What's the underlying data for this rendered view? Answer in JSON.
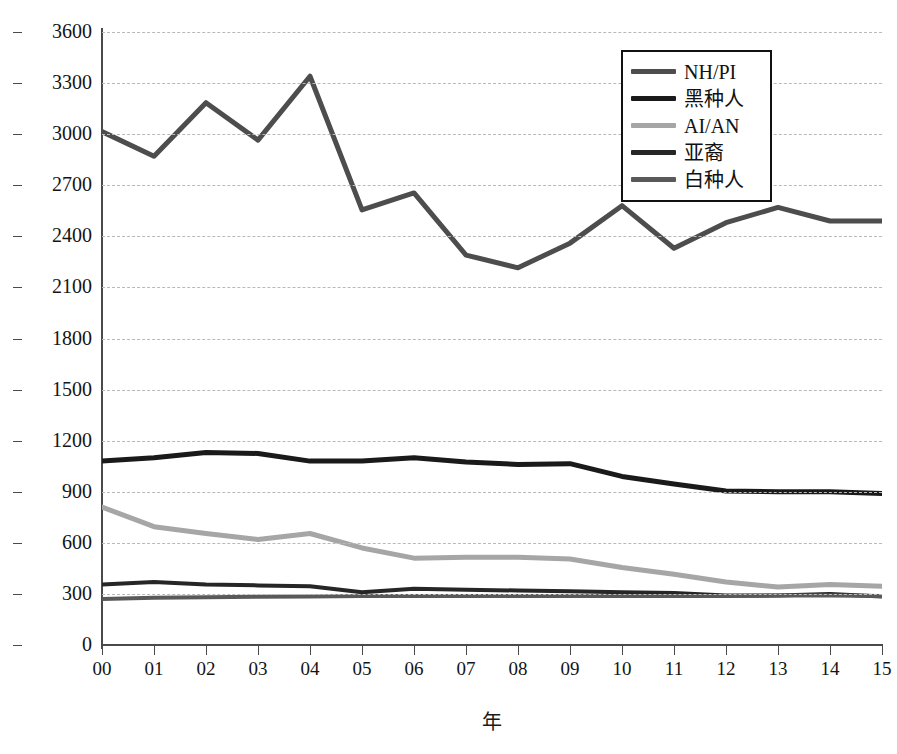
{
  "chart_data": {
    "type": "line",
    "title": "",
    "xlabel": "年",
    "ylabel": "发病率（每一百万人口/年）",
    "categories": [
      "00",
      "01",
      "02",
      "03",
      "04",
      "05",
      "06",
      "07",
      "08",
      "09",
      "10",
      "11",
      "12",
      "13",
      "14",
      "15"
    ],
    "xlim": [
      0,
      15
    ],
    "ylim": [
      0,
      3600
    ],
    "yticks": [
      0,
      300,
      600,
      900,
      1200,
      1500,
      1800,
      2100,
      2400,
      2700,
      3000,
      3300,
      3600
    ],
    "ytick_labels": [
      "0",
      "300",
      "600",
      "900",
      "1200",
      "1500",
      "1800",
      "2100",
      "2400",
      "2700",
      "3000",
      "3300",
      "3600"
    ],
    "grid": true,
    "legend_position": "top-right",
    "series": [
      {
        "name": "NH/PI",
        "color": "#4d4d4d",
        "width": 5,
        "values": [
          3015,
          2870,
          3185,
          2965,
          3340,
          2555,
          2655,
          2290,
          2215,
          2360,
          2580,
          2330,
          2480,
          2570,
          2490,
          2490
        ]
      },
      {
        "name": "黑种人",
        "color": "#1a1a1a",
        "width": 5,
        "values": [
          1080,
          1100,
          1130,
          1125,
          1080,
          1080,
          1100,
          1075,
          1060,
          1065,
          990,
          945,
          905,
          900,
          900,
          890
        ]
      },
      {
        "name": "AI/AN",
        "color": "#a6a6a6",
        "width": 5,
        "values": [
          810,
          695,
          655,
          620,
          655,
          570,
          510,
          515,
          515,
          505,
          455,
          415,
          370,
          340,
          355,
          345
        ]
      },
      {
        "name": "亚裔",
        "color": "#262626",
        "width": 4,
        "values": [
          355,
          370,
          355,
          350,
          345,
          310,
          330,
          325,
          320,
          315,
          310,
          305,
          290,
          290,
          300,
          285
        ]
      },
      {
        "name": "白种人",
        "color": "#595959",
        "width": 4,
        "values": [
          270,
          277,
          280,
          283,
          285,
          288,
          288,
          288,
          288,
          288,
          288,
          288,
          288,
          290,
          290,
          288
        ]
      }
    ]
  },
  "axes": {
    "y_title": "发病率（每一百万人口/年）",
    "x_title": "年"
  },
  "legend": {
    "items": [
      {
        "label": "NH/PI",
        "color": "#4d4d4d"
      },
      {
        "label": "黑种人",
        "color": "#1a1a1a"
      },
      {
        "label": "AI/AN",
        "color": "#a6a6a6"
      },
      {
        "label": "亚裔",
        "color": "#262626"
      },
      {
        "label": "白种人",
        "color": "#595959"
      }
    ]
  }
}
